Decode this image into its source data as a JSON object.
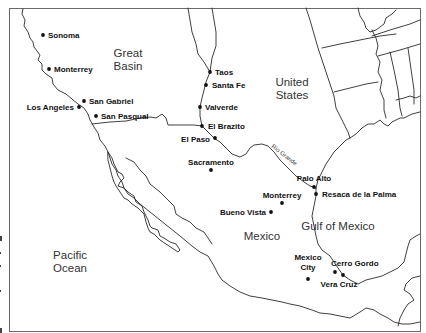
{
  "map": {
    "regions": [
      {
        "id": "great-basin",
        "lines": [
          "Great",
          "Basin"
        ],
        "x": 128,
        "y": 57
      },
      {
        "id": "united-states",
        "lines": [
          "United",
          "States"
        ],
        "x": 292,
        "y": 86
      },
      {
        "id": "gulf-of-mexico",
        "lines": [
          "Gulf of Mexico"
        ],
        "x": 338,
        "y": 230
      },
      {
        "id": "mexico",
        "lines": [
          "Mexico"
        ],
        "x": 262,
        "y": 240
      },
      {
        "id": "pacific-ocean",
        "lines": [
          "Pacific",
          "Ocean"
        ],
        "x": 70,
        "y": 259
      }
    ],
    "cities": [
      {
        "name": "Sonoma",
        "dot": [
          43,
          35
        ],
        "label": [
          48,
          38
        ],
        "anchor": "start"
      },
      {
        "name": "Monterrey",
        "dot": [
          49,
          69
        ],
        "label": [
          54,
          72
        ],
        "anchor": "start"
      },
      {
        "name": "San Gabriel",
        "dot": [
          84,
          101
        ],
        "label": [
          89,
          104
        ],
        "anchor": "start"
      },
      {
        "name": "Los Angeles",
        "dot": [
          79,
          107
        ],
        "label": [
          74,
          110
        ],
        "anchor": "end"
      },
      {
        "name": "San Pasqual",
        "dot": [
          96,
          116
        ],
        "label": [
          101,
          119
        ],
        "anchor": "start"
      },
      {
        "name": "Taos",
        "dot": [
          210,
          72
        ],
        "label": [
          215,
          75
        ],
        "anchor": "start"
      },
      {
        "name": "Santa Fe",
        "dot": [
          206,
          85
        ],
        "label": [
          212,
          88
        ],
        "anchor": "start"
      },
      {
        "name": "Valverde",
        "dot": [
          200,
          107
        ],
        "label": [
          205,
          110
        ],
        "anchor": "start"
      },
      {
        "name": "El Brazito",
        "dot": [
          202,
          126
        ],
        "label": [
          208,
          129
        ],
        "anchor": "start"
      },
      {
        "name": "El Paso",
        "dot": [
          215,
          138
        ],
        "label": [
          210,
          142
        ],
        "anchor": "end"
      },
      {
        "name": "Sacramento",
        "dot": [
          211,
          170
        ],
        "label": [
          211,
          165
        ],
        "anchor": "middle"
      },
      {
        "name": "Palo Alto",
        "dot": [
          314,
          187
        ],
        "label": [
          314,
          181
        ],
        "anchor": "middle"
      },
      {
        "name": "Resaca de la Palma",
        "dot": [
          316,
          194
        ],
        "label": [
          322,
          197
        ],
        "anchor": "start"
      },
      {
        "name": "Monterrey",
        "dot": [
          282,
          203
        ],
        "label": [
          282,
          198
        ],
        "anchor": "middle"
      },
      {
        "name": "Bueno Vista",
        "dot": [
          271,
          212
        ],
        "label": [
          266,
          215
        ],
        "anchor": "end"
      },
      {
        "name": "Mexico City",
        "dot": [
          308,
          279
        ],
        "label": [
          308,
          260
        ],
        "label2": [
          308,
          270
        ],
        "anchor": "middle",
        "lines": [
          "Mexico",
          "City"
        ]
      },
      {
        "name": "Cerro Gordo",
        "dot": [
          335,
          272
        ],
        "label": [
          331,
          266
        ],
        "anchor": "start"
      },
      {
        "name": "Vera Cruz",
        "dot": [
          343,
          275
        ],
        "label": [
          339,
          287
        ],
        "anchor": "middle"
      }
    ],
    "river": {
      "name": "Rio Grande",
      "x": 271,
      "y": 147,
      "rotate": 38
    }
  }
}
